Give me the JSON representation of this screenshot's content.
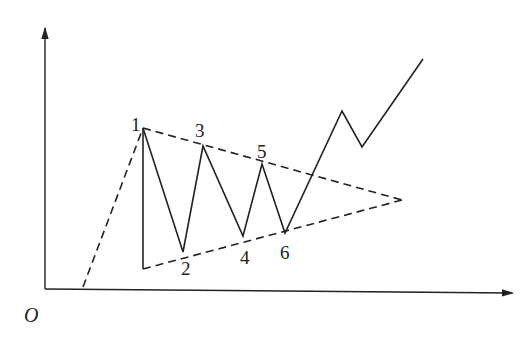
{
  "diagram": {
    "origin_label": "O",
    "axes": {
      "origin": [
        45,
        289
      ],
      "y_axis_top": [
        45,
        28
      ],
      "x_axis_end": [
        513,
        293
      ]
    },
    "points": [
      {
        "id": "1",
        "label": "1",
        "x": 143,
        "y": 128,
        "label_x": 131,
        "label_y": 131
      },
      {
        "id": "2",
        "label": "2",
        "x": 183,
        "y": 252,
        "label_x": 181,
        "label_y": 275
      },
      {
        "id": "3",
        "label": "3",
        "x": 203,
        "y": 146,
        "label_x": 195,
        "label_y": 137
      },
      {
        "id": "4",
        "label": "4",
        "x": 243,
        "y": 236,
        "label_x": 240,
        "label_y": 264
      },
      {
        "id": "5",
        "label": "5",
        "x": 262,
        "y": 164,
        "label_x": 257,
        "label_y": 158
      },
      {
        "id": "6",
        "label": "6",
        "x": 285,
        "y": 233,
        "label_x": 280,
        "label_y": 259
      }
    ],
    "price_path": [
      [
        143,
        128
      ],
      [
        183,
        252
      ],
      [
        203,
        146
      ],
      [
        243,
        236
      ],
      [
        262,
        164
      ],
      [
        285,
        233
      ],
      [
        342,
        111
      ],
      [
        362,
        147
      ],
      [
        423,
        59
      ]
    ],
    "initial_trend_dashed": [
      [
        83,
        287
      ],
      [
        143,
        128
      ]
    ],
    "vertical_base_line": [
      [
        143,
        128
      ],
      [
        143,
        269
      ]
    ],
    "upper_trendline_dashed": [
      [
        143,
        128
      ],
      [
        402,
        200
      ]
    ],
    "lower_trendline_dashed": [
      [
        143,
        269
      ],
      [
        402,
        200
      ]
    ],
    "apex": [
      402,
      200
    ]
  }
}
